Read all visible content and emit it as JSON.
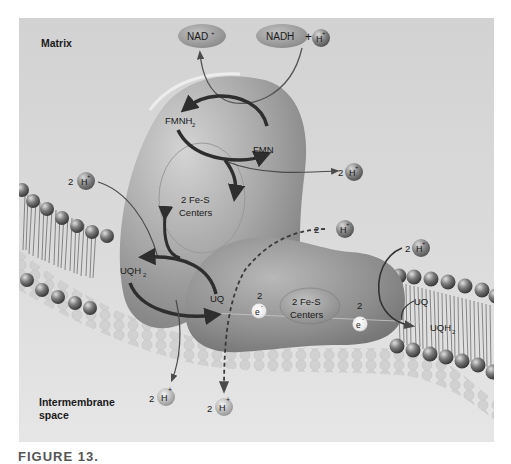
{
  "regions": {
    "matrix": "Matrix",
    "intermembrane_1": "Intermembrane",
    "intermembrane_2": "space"
  },
  "molecules": {
    "nad_plus": "NAD",
    "nad_plus_sup": "+",
    "nadh": "NADH",
    "plus_sign": "+",
    "fmnh2": "FMNH",
    "fmnh2_sub": "2",
    "fmn": "FMN",
    "uqh2_left": "UQH",
    "uqh2_left_sub": "2",
    "uq_left": "UQ",
    "uq_right": "UQ",
    "uqh2_right": "UQH",
    "uqh2_right_sub": "2"
  },
  "centers": {
    "upper_line1": "2 Fe-S",
    "upper_line2": "Centers",
    "lower_line1": "2 Fe-S",
    "lower_line2": "Centers"
  },
  "protons": {
    "symbol": "H",
    "charge": "+",
    "count": "2"
  },
  "electrons": {
    "symbol": "e",
    "charge": "-",
    "count": "2"
  },
  "caption": "FIGURE 13.",
  "colors": {
    "background": "#dcdcdc",
    "protein": "#9c9c9c",
    "arrow": "#2e2e2e",
    "proton_ball": "#6a6a6a",
    "ellipse": "#8e8e8e"
  }
}
